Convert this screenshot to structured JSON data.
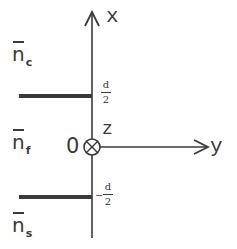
{
  "diagram": {
    "type": "slab waveguide cross-section",
    "axes": {
      "x_label": "x",
      "y_label": "y",
      "z_label": "z",
      "origin_label": "0",
      "z_direction": "into page (circle-cross)"
    },
    "regions": [
      {
        "name": "cover",
        "symbol": "n",
        "subscript": "c",
        "label": "n̄c"
      },
      {
        "name": "film",
        "symbol": "n",
        "subscript": "f",
        "label": "n̄f"
      },
      {
        "name": "substrate",
        "symbol": "n",
        "subscript": "s",
        "label": "n̄s"
      }
    ],
    "boundaries": {
      "top": {
        "numerator": "d",
        "denominator": "2",
        "sign": ""
      },
      "bottom": {
        "numerator": "d",
        "denominator": "2",
        "sign": "−"
      }
    },
    "colors": {
      "line": "#3a3a3a",
      "thick_boundary": "#3a3a3a",
      "background": "#ffffff"
    }
  }
}
